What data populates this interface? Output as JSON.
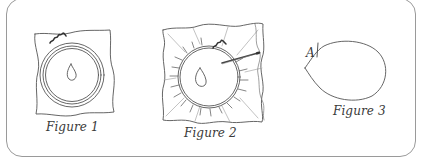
{
  "figures": [
    {
      "id": "figure-1",
      "caption": "Figure 1",
      "depicts": "fabric square with concentric circles, central drop shape and wavy stitch mark"
    },
    {
      "id": "figure-2",
      "caption": "Figure 2",
      "depicts": "fabric gathered around circle with radiating folds, drop shape, and needle with thread"
    },
    {
      "id": "figure-3",
      "caption": "Figure 3",
      "depicts": "teardrop shape with point labeled A",
      "point_label": "A"
    }
  ],
  "colors": {
    "line": "#555555",
    "frame": "#9a9a9a",
    "text": "#3a3a3a",
    "background": "#ffffff"
  }
}
